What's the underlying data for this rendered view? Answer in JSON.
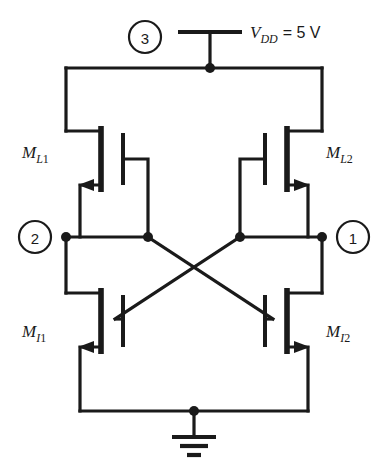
{
  "figure": {
    "background_color": "#ffffff",
    "line_color": "#1a1a1a"
  },
  "supply": {
    "symbol_name": "vdd-terminal",
    "label_main": "V",
    "label_sub": "DD",
    "label_value": "= 5 V",
    "full_text": "VDD = 5 V"
  },
  "ground": {
    "symbol_name": "ground-symbol",
    "bars": 3
  },
  "nodes": [
    {
      "id": "node-1",
      "label": "1",
      "cx": 345,
      "cy": 237
    },
    {
      "id": "node-2",
      "label": "2",
      "cx": 35,
      "cy": 237
    },
    {
      "id": "node-3",
      "label": "3",
      "cx": 145,
      "cy": 37
    }
  ],
  "transistors": [
    {
      "id": "ml1",
      "label_main": "M",
      "label_sub": "L",
      "label_sub_num": "1",
      "full_label": "ML1",
      "role": "load",
      "side": "left",
      "arrow_direction": "left"
    },
    {
      "id": "ml2",
      "label_main": "M",
      "label_sub": "L",
      "label_sub_num": "2",
      "full_label": "ML2",
      "role": "load",
      "side": "right",
      "arrow_direction": "right"
    },
    {
      "id": "mi1",
      "label_main": "M",
      "label_sub": "I",
      "label_sub_num": "1",
      "full_label": "MI1",
      "role": "input-driver",
      "side": "left",
      "arrow_direction": "left"
    },
    {
      "id": "mi2",
      "label_main": "M",
      "label_sub": "I",
      "label_sub_num": "2",
      "full_label": "MI2",
      "role": "input-driver",
      "side": "right",
      "arrow_direction": "right"
    }
  ],
  "connections": {
    "cross_coupling": "drain of each driver tied to gate of the opposite driver",
    "top_rail": "VDD rail across both load transistor drains",
    "bottom_rail": "common source rail to ground"
  }
}
